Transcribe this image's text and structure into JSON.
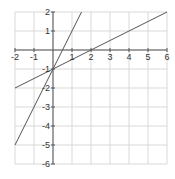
{
  "chart_data": {
    "type": "line",
    "title": "",
    "xlabel": "",
    "ylabel": "",
    "xlim": [
      -2,
      6
    ],
    "ylim": [
      -6,
      2
    ],
    "grid": true,
    "x_ticks": [
      -2,
      -1,
      1,
      2,
      3,
      4,
      5,
      6
    ],
    "y_ticks": [
      2,
      1,
      -1,
      -2,
      -3,
      -4,
      -5,
      -6
    ],
    "x_tick_labels": [
      "-2",
      "-1",
      "1",
      "2",
      "3",
      "4",
      "5",
      "6"
    ],
    "y_tick_labels": [
      "2",
      "1",
      "-1",
      "-2",
      "-3",
      "-4",
      "-5",
      "-6"
    ],
    "series": [
      {
        "name": "y = 2x - 1",
        "slope": 2,
        "intercept": -1,
        "points": [
          [
            -2,
            -5
          ],
          [
            1.5,
            2
          ]
        ],
        "color": "#555555"
      },
      {
        "name": "y = 0.5x - 1",
        "slope": 0.5,
        "intercept": -1,
        "points": [
          [
            -2,
            -2
          ],
          [
            6,
            2
          ]
        ],
        "color": "#555555"
      }
    ],
    "colors": {
      "grid": "#d9d9d9",
      "axis": "#555555",
      "text": "#333333"
    }
  }
}
